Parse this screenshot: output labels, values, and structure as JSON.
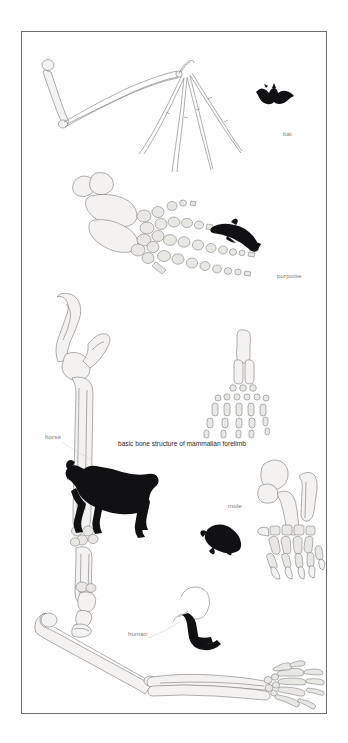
{
  "plate": {
    "title": "basic bone structure of mammalian forelimb",
    "background_color": "#ffffff",
    "border_color": "#6e6e70",
    "bone_fill_color": "#f3f2f0",
    "bone_outline_color": "#6f6e70",
    "silhouette_color": "#111113",
    "label_color": "#7c7c7e",
    "caption_color": "#2a2a2c"
  },
  "caption": {
    "text": "basic bone structure of mammalian forelimb"
  },
  "specimens": [
    {
      "id": "bat",
      "label": "bat",
      "description": "elongated forelimb with greatly extended finger bones forming wing"
    },
    {
      "id": "porpoise",
      "label": "porpoise",
      "description": "broad flipper with shortened, blocky, numerous phalanges"
    },
    {
      "id": "horse",
      "label": "horse",
      "description": "elongated single-digit limb ending in hoof"
    },
    {
      "id": "mole",
      "label": "mole",
      "description": "short broad digging forelimb with heavy claws"
    },
    {
      "id": "human",
      "label": "human",
      "description": "arm with humerus, radius, ulna, carpals and five digits"
    }
  ],
  "schematic": {
    "name": "generic-mammalian-forelimb",
    "segments": [
      "humerus",
      "radius",
      "ulna",
      "carpals",
      "metacarpals",
      "phalanges"
    ],
    "digit_count": 5
  }
}
